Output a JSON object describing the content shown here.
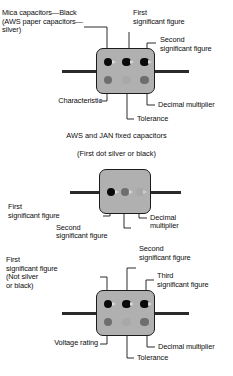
{
  "figure": {
    "background_color": "#ffffff",
    "body_color": "#b0b0b0",
    "outline_color": "#1b1b1b",
    "lead_color": "#2a2a2a",
    "dot_colors": {
      "black": "#0a0a0a",
      "dark_gray": "#6e6e6e",
      "light_gray_silver": "#a8a8a8"
    }
  },
  "diagram1": {
    "name": "six-dot-capacitor",
    "rows": 2,
    "dots_per_row": 3,
    "top_row": [
      "black",
      "black",
      "black"
    ],
    "bottom_row": [
      "dark",
      "light",
      "dark"
    ],
    "labels": {
      "top_left": "Mica capacitors—Black\n(AWS paper capacitors—\nsilver)",
      "first_significant": "First\nsignificant figure",
      "second_significant": "Second\nsignificant figure",
      "characteristic": "Characteristic",
      "tolerance": "Tolerance",
      "decimal_multiplier": "Decimal multiplier"
    },
    "caption_line1": "AWS and JAN fixed capacitors",
    "caption_line2": "(First dot silver or black)"
  },
  "diagram2": {
    "name": "three-dot-capacitor",
    "rows": 1,
    "dots_per_row": 3,
    "row": [
      "black",
      "dark",
      "light"
    ],
    "labels": {
      "first_significant": "First\nsignificant figure",
      "second_significant": "Second\nsignificant figure",
      "decimal_multiplier": "Decimal\nmultiplier"
    }
  },
  "diagram3": {
    "name": "six-dot-capacitor-voltage",
    "rows": 2,
    "dots_per_row": 3,
    "top_row": [
      "black",
      "black",
      "black"
    ],
    "bottom_row": [
      "dark",
      "light",
      "dark"
    ],
    "labels": {
      "first_significant": "First\nsignificant figure\n(Not silver\nor black)",
      "second_significant": "Second\nsignificant figure",
      "third_significant": "Third\nsignificant figure",
      "voltage_rating": "Voltage rating",
      "tolerance": "Tolerance",
      "decimal_multiplier": "Decimal multiplier"
    }
  }
}
